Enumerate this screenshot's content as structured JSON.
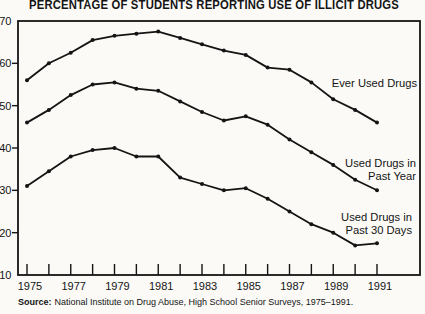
{
  "page": {
    "title": "PERCENTAGE OF STUDENTS REPORTING USE OF ILLICIT DRUGS",
    "source_label": "Source:",
    "source_text": "National Institute on Drug Abuse, High School Senior Surveys, 1975–1991."
  },
  "colors": {
    "ink": "#141414",
    "paper": "#fbfaf7"
  },
  "chart_data": {
    "type": "line",
    "title": "PERCENTAGE OF STUDENTS REPORTING USE OF ILLICIT DRUGS",
    "x": [
      1975,
      1976,
      1977,
      1978,
      1979,
      1980,
      1981,
      1982,
      1983,
      1984,
      1985,
      1986,
      1987,
      1988,
      1989,
      1990,
      1991
    ],
    "x_tick_labels": [
      "1975",
      "1977",
      "1979",
      "1981",
      "1983",
      "1985",
      "1987",
      "1989",
      "1991"
    ],
    "xlabel": "",
    "ylabel": "",
    "ylim": [
      10,
      70
    ],
    "yticks": [
      10,
      20,
      30,
      40,
      50,
      60,
      70
    ],
    "grid": false,
    "legend": "inline-labels",
    "series": [
      {
        "name": "Ever Used Drugs",
        "label_lines": [
          "Ever Used Drugs"
        ],
        "values": [
          56,
          60,
          62.5,
          65.5,
          66.5,
          67,
          67.5,
          66,
          64.5,
          63,
          62,
          59,
          58.5,
          55.5,
          51.5,
          49,
          46
        ]
      },
      {
        "name": "Used Drugs in Past Year",
        "label_lines": [
          "Used Drugs in",
          "Past Year"
        ],
        "values": [
          46,
          49,
          52.5,
          55,
          55.5,
          54,
          53.5,
          51,
          48.5,
          46.5,
          47.5,
          45.5,
          42,
          39,
          36,
          32.5,
          30
        ]
      },
      {
        "name": "Used Drugs in Past 30 Days",
        "label_lines": [
          "Used Drugs in",
          "Past 30 Days"
        ],
        "values": [
          31,
          34.5,
          38,
          39.5,
          40,
          38,
          38,
          33,
          31.5,
          30,
          30.5,
          28,
          25,
          22,
          20,
          17,
          17.5
        ]
      }
    ],
    "source": "Source: National Institute on Drug Abuse, High School Senior Surveys, 1975–1991."
  }
}
